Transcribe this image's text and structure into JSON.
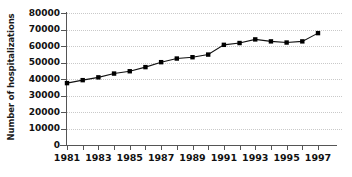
{
  "chart_data": {
    "type": "line",
    "title": "",
    "xlabel": "",
    "ylabel": "Number of hospitalizations",
    "x": [
      1981,
      1982,
      1983,
      1984,
      1985,
      1986,
      1987,
      1988,
      1989,
      1990,
      1991,
      1992,
      1993,
      1994,
      1995,
      1996,
      1997
    ],
    "values": [
      37500,
      39300,
      41000,
      43300,
      44700,
      47200,
      50200,
      52400,
      53200,
      54800,
      60700,
      61800,
      64000,
      62800,
      62100,
      62800,
      67800
    ],
    "series": [
      {
        "name": "Number of hospitalizations",
        "values": [
          37500,
          39300,
          41000,
          43300,
          44700,
          47200,
          50200,
          52400,
          53200,
          54800,
          60700,
          61800,
          64000,
          62800,
          62100,
          62800,
          67800
        ]
      }
    ],
    "xlim": [
      1981,
      1997
    ],
    "ylim": [
      0,
      80000
    ],
    "yticks": [
      0,
      10000,
      20000,
      30000,
      40000,
      50000,
      60000,
      70000,
      80000
    ],
    "ytick_labels": [
      "0",
      "10000",
      "20000",
      "30000",
      "40000",
      "50000",
      "60000",
      "70000",
      "80000"
    ],
    "xticks": [
      1981,
      1982,
      1983,
      1984,
      1985,
      1986,
      1987,
      1988,
      1989,
      1990,
      1991,
      1992,
      1993,
      1994,
      1995,
      1996,
      1997
    ],
    "xtick_labels": [
      "1981",
      "",
      "1983",
      "",
      "1985",
      "",
      "1987",
      "",
      "1989",
      "",
      "1991",
      "",
      "1993",
      "",
      "1995",
      "",
      "1997"
    ],
    "xtick_labels_visible": [
      "1981",
      "1983",
      "1985",
      "1987",
      "1989",
      "1991",
      "1993",
      "1995",
      "1997"
    ],
    "grid": "horizontal-dotted",
    "legend": "none",
    "line_color": "#111111",
    "marker": "square",
    "marker_color": "#000000",
    "grid_color": "#c9c9c9",
    "axis_color": "#555555",
    "background": "#ffffff"
  }
}
